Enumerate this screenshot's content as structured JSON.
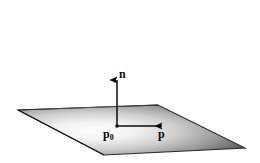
{
  "figure": {
    "background_color": "#ffffff",
    "stroke_color": "#1a1a1a",
    "plane": {
      "name": "shaded-plane-parallelogram",
      "fill_light": "#fbfbfb",
      "fill_mid": "#b4b4b4",
      "fill_dark": "#3a3a3a",
      "edge_color": "#2b2b2b",
      "vertices": [
        {
          "x": 18,
          "y": 110
        },
        {
          "x": 158,
          "y": 105
        },
        {
          "x": 245,
          "y": 148
        },
        {
          "x": 104,
          "y": 155
        }
      ]
    },
    "normal_vector": {
      "name": "normal-vector-n",
      "label": "n",
      "from": {
        "x": 117,
        "y": 127
      },
      "to": {
        "x": 117,
        "y": 78
      },
      "label_position": {
        "x": 119,
        "y": 68
      }
    },
    "point_vector": {
      "name": "point-vector-p",
      "label": "p",
      "from": {
        "x": 117,
        "y": 126
      },
      "to": {
        "x": 164,
        "y": 126
      },
      "label_position": {
        "x": 158,
        "y": 128
      }
    },
    "base_point": {
      "name": "base-point-p0",
      "label": "p",
      "subscript": "0",
      "position": {
        "x": 117,
        "y": 126
      },
      "label_position": {
        "x": 103,
        "y": 128
      }
    }
  }
}
